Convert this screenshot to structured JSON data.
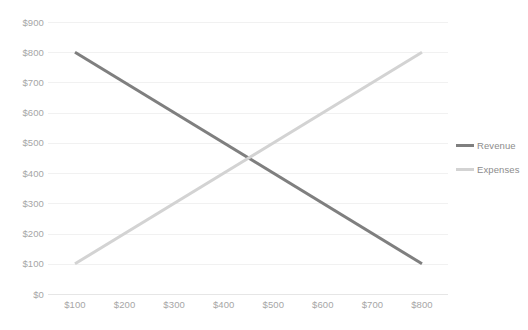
{
  "chart_data": {
    "type": "line",
    "title": "",
    "subtitle": "",
    "xlabel": "",
    "ylabel": "",
    "xlim": [
      100,
      800
    ],
    "ylim": [
      0,
      900
    ],
    "x": [
      100,
      800
    ],
    "x_tick_labels": [
      "$100",
      "$200",
      "$300",
      "$400",
      "$500",
      "$600",
      "$700",
      "$800"
    ],
    "x_tick_values": [
      100,
      200,
      300,
      400,
      500,
      600,
      700,
      800
    ],
    "y_tick_labels": [
      "$900",
      "$800",
      "$700",
      "$600",
      "$500",
      "$400",
      "$300",
      "$200",
      "$100",
      "$0"
    ],
    "y_tick_values": [
      900,
      800,
      700,
      600,
      500,
      400,
      300,
      200,
      100,
      0
    ],
    "grid": true,
    "legend_position": "right",
    "series": [
      {
        "name": "Revenue",
        "color": "#7f7f7f",
        "x": [
          100,
          800
        ],
        "values": [
          800,
          100
        ]
      },
      {
        "name": "Expenses",
        "color": "#d3d3d3",
        "x": [
          100,
          800
        ],
        "values": [
          100,
          800
        ]
      }
    ],
    "intersection": {
      "x": 450,
      "y": 450
    },
    "colors": {
      "background": "#ffffff",
      "gridline": "#f1f1f1",
      "axis": "#e6e6e6",
      "tick_label": "#a6a6a6",
      "legend_label": "#8c8c8c"
    }
  }
}
